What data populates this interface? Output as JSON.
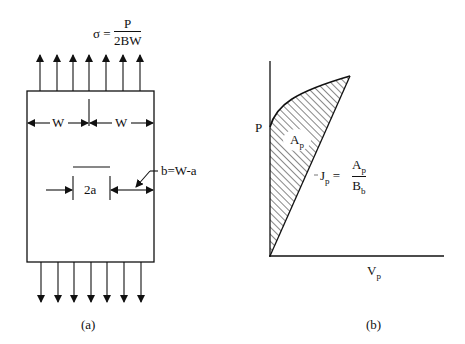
{
  "panel_a": {
    "stress_formula": {
      "lhs": "σ =",
      "numerator": "P",
      "denominator": "2BW"
    },
    "width_label_left": "W",
    "width_label_right": "W",
    "crack_label": "2a",
    "ligament_label": "b=W-a",
    "caption": "(a)"
  },
  "panel_b": {
    "y_axis_label": "P",
    "x_axis_label_main": "V",
    "x_axis_label_sub": "p",
    "area_label_main": "A",
    "area_label_sub": "p",
    "j_formula": {
      "lhs_main": "J",
      "lhs_sub": "p",
      "equals": "=",
      "numerator_main": "A",
      "numerator_sub": "p",
      "denominator_main": "B",
      "denominator_sub": "b"
    },
    "caption": "(b)"
  }
}
